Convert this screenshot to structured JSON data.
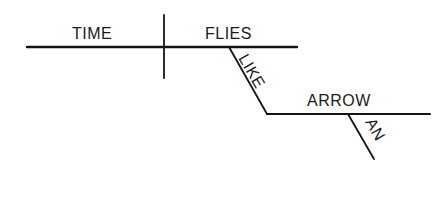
{
  "diagram": {
    "type": "sentence-diagram",
    "words": {
      "subject": "TIME",
      "verb": "FLIES",
      "preposition": "LIKE",
      "object": "ARROW",
      "article": "AN"
    },
    "colors": {
      "line": "#141414",
      "text": "#1a1a1a",
      "background": "#ffffff"
    }
  }
}
